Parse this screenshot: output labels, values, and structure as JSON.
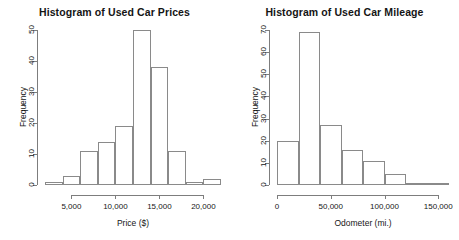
{
  "figure": {
    "background": "#ffffff",
    "bar_outline_color": "#8a8a8a",
    "axis_color": "#7d7d7d",
    "text_color": "#161616"
  },
  "chart_data": [
    {
      "type": "bar",
      "subtype": "histogram",
      "title": "Histogram of Used Car Prices",
      "xlabel": "Price ($)",
      "ylabel": "Frequency",
      "bin_edges": [
        2000,
        4000,
        6000,
        8000,
        10000,
        12000,
        14000,
        16000,
        18000,
        20000,
        22000
      ],
      "bin_labels": [
        "2,000-4,000",
        "4,000-6,000",
        "6,000-8,000",
        "8,000-10,000",
        "10,000-12,000",
        "12,000-14,000",
        "14,000-16,000",
        "16,000-18,000",
        "18,000-20,000",
        "20,000-22,000"
      ],
      "values": [
        1,
        3,
        11,
        14,
        19,
        50,
        38,
        11,
        1,
        2
      ],
      "xlim": [
        2000,
        22000
      ],
      "ylim": [
        0,
        50
      ],
      "xticks": [
        5000,
        10000,
        15000,
        20000
      ],
      "xticklabels": [
        "5,000",
        "10,000",
        "15,000",
        "20,000"
      ],
      "yticks": [
        0,
        10,
        20,
        30,
        40,
        50
      ],
      "yticklabels": [
        "0",
        "10",
        "20",
        "30",
        "40",
        "50"
      ],
      "grid": false,
      "legend": "none"
    },
    {
      "type": "bar",
      "subtype": "histogram",
      "title": "Histogram of Used Car Mileage",
      "xlabel": "Odometer (mi.)",
      "ylabel": "Frequency",
      "bin_edges": [
        0,
        20000,
        40000,
        60000,
        80000,
        100000,
        120000,
        140000,
        160000
      ],
      "bin_labels": [
        "0-20,000",
        "20,000-40,000",
        "40,000-60,000",
        "60,000-80,000",
        "80,000-100,000",
        "100,000-120,000",
        "120,000-140,000",
        "140,000-160,000"
      ],
      "values": [
        20,
        69,
        27,
        16,
        11,
        5,
        1,
        1
      ],
      "xlim": [
        0,
        160000
      ],
      "ylim": [
        0,
        70
      ],
      "xticks": [
        0,
        50000,
        100000,
        150000
      ],
      "xticklabels": [
        "0",
        "50,000",
        "100,000",
        "150,000"
      ],
      "yticks": [
        0,
        10,
        20,
        30,
        40,
        50,
        60,
        70
      ],
      "yticklabels": [
        "0",
        "10",
        "20",
        "30",
        "40",
        "50",
        "60",
        "70"
      ],
      "grid": false,
      "legend": "none"
    }
  ]
}
